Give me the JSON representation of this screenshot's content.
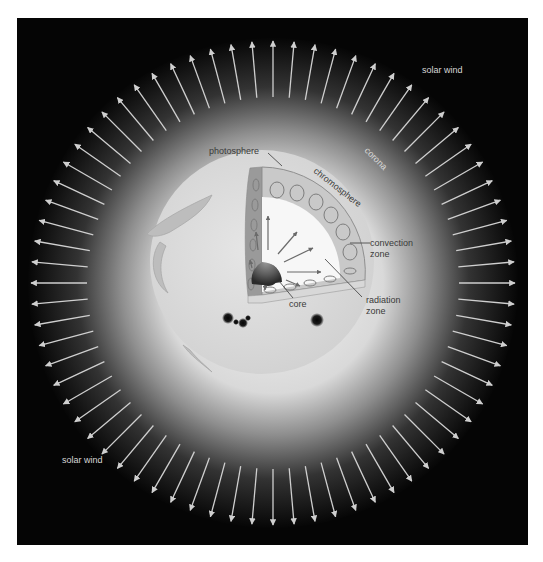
{
  "diagram": {
    "background_color": "#050505",
    "arrow_color": "#cfcfcf",
    "labels": {
      "solar_wind_top": "solar wind",
      "solar_wind_bottom": "solar wind",
      "corona": "corona",
      "photosphere": "photosphere",
      "chromosphere": "chromosphere",
      "convection_zone_line1": "convection",
      "convection_zone_line2": "zone",
      "radiation_zone_line1": "radiation",
      "radiation_zone_line2": "zone",
      "core": "core"
    },
    "features": {
      "solar_wind_arrow_count": 72,
      "sunspots": 2,
      "prominences": 2,
      "cutaway": "quarter section showing core, radiation zone, convection zone"
    }
  }
}
